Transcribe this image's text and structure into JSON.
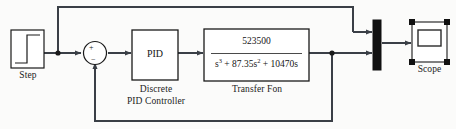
{
  "diagram": {
    "line_color": "#3a3f46",
    "block_border_color": "#1a1a1a",
    "fill_color": "#ffffff",
    "background_color": "#fbfbfa",
    "selection_handle_color": "#111111"
  },
  "blocks": {
    "step": {
      "name": "step-block",
      "label": "Step",
      "icon": "step-function-icon"
    },
    "sum": {
      "name": "sum-junction",
      "plus_sign": "+",
      "minus_sign": "−"
    },
    "pid": {
      "name": "pid-block",
      "text": "PID",
      "label": "Discrete\nPID Controller"
    },
    "transfer_fcn": {
      "name": "transfer-function-block",
      "numerator": "523500",
      "denominator_parts": [
        {
          "base": "s",
          "exp": "3"
        },
        {
          "text": " + 87.35"
        },
        {
          "base": "s",
          "exp": "2"
        },
        {
          "text": " + 10470s"
        }
      ],
      "denominator_plain": "s3 + 87.35s2 + 10470s",
      "label": "Transfer Fon"
    },
    "mux": {
      "name": "mux-block",
      "inputs": 2,
      "label": ""
    },
    "scope": {
      "name": "scope-block",
      "label": "Scope",
      "selected": true,
      "handle_count": 4
    }
  },
  "signals": {
    "step_to_sum": "step-output-line",
    "sum_to_pid": "sum-to-pid-line",
    "pid_to_tf": "pid-to-transfer-line",
    "tf_to_mux": "transfer-to-mux-line",
    "mux_to_scope": "mux-to-scope-line",
    "feedforward_top": "step-tap-to-mux-feedforward",
    "feedback_bottom": "output-tap-to-sum-feedback"
  }
}
